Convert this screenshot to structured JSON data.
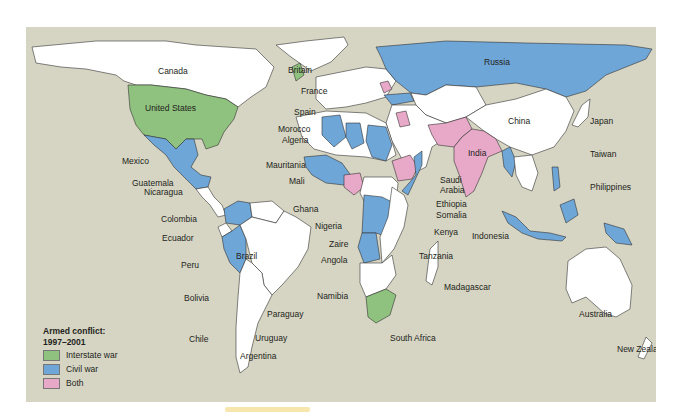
{
  "legend": {
    "title_line1": "Armed conflict:",
    "title_line2": "1997–2001",
    "items": [
      {
        "label": "Interstate war",
        "color": "#8fc27e"
      },
      {
        "label": "Civil war",
        "color": "#6ea6d8"
      },
      {
        "label": "Both",
        "color": "#e8a9c9"
      }
    ]
  },
  "colors": {
    "ocean": "#d6d5c3",
    "no_conflict": "#ffffff",
    "interstate": "#8fc27e",
    "civil": "#6ea6d8",
    "both": "#e8a9c9"
  },
  "labels": {
    "canada": "Canada",
    "united_states": "United States",
    "mexico": "Mexico",
    "guatemala": "Guatemala",
    "nicaragua": "Nicaragua",
    "colombia": "Colombia",
    "ecuador": "Ecuador",
    "peru": "Peru",
    "brazil": "Brazil",
    "bolivia": "Bolivia",
    "paraguay": "Paraguay",
    "chile": "Chile",
    "uruguay": "Uruguay",
    "argentina": "Argentina",
    "britain": "Britain",
    "france": "France",
    "spain": "Spain",
    "morocco": "Morocco",
    "algeria": "Algeria",
    "mauritania": "Mauritania",
    "mali": "Mali",
    "ghana": "Ghana",
    "nigeria": "Nigeria",
    "zaire": "Zaire",
    "angola": "Angola",
    "namibia": "Namibia",
    "south_africa": "South Africa",
    "saudi_arabia_1": "Saudi",
    "saudi_arabia_2": "Arabia",
    "ethiopia": "Ethiopia",
    "somalia": "Somalia",
    "kenya": "Kenya",
    "tanzania": "Tanzania",
    "madagascar": "Madagascar",
    "russia": "Russia",
    "china": "China",
    "india": "India",
    "japan": "Japan",
    "taiwan": "Taiwan",
    "philippines": "Philippines",
    "indonesia": "Indonesia",
    "australia": "Australia",
    "new_zealand": "New Zealand"
  }
}
